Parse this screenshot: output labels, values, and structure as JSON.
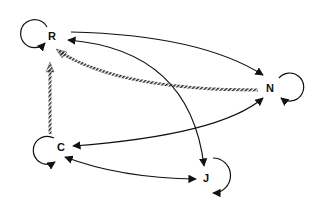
{
  "diagram": {
    "type": "directed-graph",
    "nodes": [
      {
        "id": "R",
        "label": "R",
        "x": 52,
        "y": 36,
        "self_loop": true
      },
      {
        "id": "N",
        "label": "N",
        "x": 270,
        "y": 87,
        "self_loop": true
      },
      {
        "id": "C",
        "label": "C",
        "x": 61,
        "y": 147,
        "self_loop": true
      },
      {
        "id": "J",
        "label": "J",
        "x": 206,
        "y": 178,
        "self_loop": true
      }
    ],
    "edges": [
      {
        "from": "R",
        "to": "N",
        "style": "solid",
        "direction": "forward"
      },
      {
        "from": "R",
        "to": "J",
        "style": "solid",
        "direction": "both"
      },
      {
        "from": "N",
        "to": "C",
        "style": "solid",
        "direction": "both"
      },
      {
        "from": "C",
        "to": "J",
        "style": "solid",
        "direction": "both"
      },
      {
        "from": "N",
        "to": "R",
        "style": "hatched",
        "direction": "forward"
      },
      {
        "from": "C",
        "to": "R",
        "style": "hatched",
        "direction": "forward"
      },
      {
        "from": "R",
        "to": "R",
        "style": "solid",
        "direction": "self"
      },
      {
        "from": "N",
        "to": "N",
        "style": "solid",
        "direction": "self"
      },
      {
        "from": "C",
        "to": "C",
        "style": "solid",
        "direction": "self"
      },
      {
        "from": "J",
        "to": "J",
        "style": "solid",
        "direction": "self"
      }
    ],
    "colors": {
      "line": "#111111",
      "background": "#ffffff"
    }
  }
}
